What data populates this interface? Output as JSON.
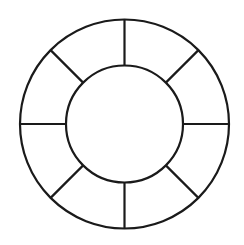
{
  "diagram": {
    "type": "segmented-ring",
    "center": {
      "x": 124.5,
      "y": 124
    },
    "outer_radius": 104.5,
    "inner_radius": 58.5,
    "segment_count": 8,
    "divider_angles_deg": [
      0,
      45,
      90,
      135,
      180,
      225,
      270,
      315
    ],
    "stroke_color": "#1a1a1a",
    "fill_color": "#ffffff",
    "stroke_width": 2.2
  }
}
